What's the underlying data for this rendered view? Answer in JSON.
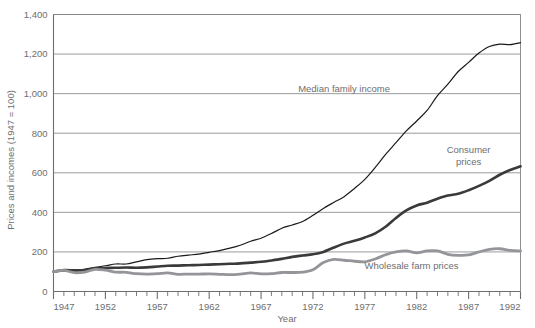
{
  "chart_data": {
    "type": "line",
    "title": "",
    "xlabel": "Year",
    "ylabel": "Prices and incomes (1947 = 100)",
    "xlim": [
      1947,
      1992
    ],
    "ylim": [
      0,
      1400
    ],
    "grid": true,
    "legend_position": "inline-annotations",
    "y_ticks": [
      0,
      200,
      400,
      600,
      800,
      1000,
      1200,
      1400
    ],
    "y_tick_labels": [
      "0",
      "200",
      "400",
      "600",
      "800",
      "1,000",
      "1,200",
      "1,400"
    ],
    "x_ticks": [
      1947,
      1952,
      1957,
      1962,
      1967,
      1972,
      1977,
      1982,
      1987,
      1992
    ],
    "x_tick_labels": [
      "1947",
      "1952",
      "1957",
      "1962",
      "1967",
      "1972",
      "1977",
      "1982",
      "1987",
      "1992"
    ],
    "x_minor_tick_interval": 1,
    "x": [
      1947,
      1948,
      1949,
      1950,
      1951,
      1952,
      1953,
      1954,
      1955,
      1956,
      1957,
      1958,
      1959,
      1960,
      1961,
      1962,
      1963,
      1964,
      1965,
      1966,
      1967,
      1968,
      1969,
      1970,
      1971,
      1972,
      1973,
      1974,
      1975,
      1976,
      1977,
      1978,
      1979,
      1980,
      1981,
      1982,
      1983,
      1984,
      1985,
      1986,
      1987,
      1988,
      1989,
      1990,
      1991,
      1992
    ],
    "series": [
      {
        "name": "Median family income",
        "label": "Median family income",
        "color": "#1a1a1a",
        "width": 1.2,
        "values": [
          100,
          104,
          103,
          112,
          122,
          130,
          139,
          139,
          150,
          161,
          166,
          168,
          178,
          184,
          189,
          198,
          207,
          219,
          234,
          254,
          269,
          293,
          320,
          336,
          354,
          385,
          420,
          450,
          479,
          521,
          567,
          627,
          693,
          752,
          812,
          862,
          915,
          990,
          1048,
          1112,
          1158,
          1205,
          1238,
          1250,
          1248,
          1258
        ]
      },
      {
        "name": "Consumer prices",
        "label": "Consumer prices",
        "color": "#3a3a3a",
        "width": 2.6,
        "values": [
          100,
          108,
          107,
          108,
          117,
          119,
          120,
          121,
          120,
          122,
          126,
          130,
          131,
          133,
          134,
          136,
          138,
          140,
          142,
          146,
          150,
          157,
          165,
          175,
          182,
          188,
          200,
          222,
          242,
          256,
          273,
          294,
          327,
          372,
          410,
          435,
          449,
          469,
          485,
          494,
          512,
          534,
          559,
          590,
          614,
          633
        ]
      },
      {
        "name": "Wholesale farm prices",
        "label": "Wholesale farm prices",
        "color": "#939598",
        "width": 2.8,
        "values": [
          100,
          107,
          95,
          98,
          112,
          108,
          98,
          97,
          90,
          88,
          90,
          94,
          87,
          88,
          88,
          89,
          87,
          85,
          88,
          94,
          89,
          90,
          96,
          96,
          98,
          110,
          146,
          162,
          158,
          153,
          150,
          164,
          186,
          200,
          205,
          195,
          205,
          205,
          188,
          183,
          185,
          200,
          213,
          216,
          208,
          205
        ]
      }
    ],
    "annotations": [
      {
        "text": "Median family income",
        "x": 1975.0,
        "y": 1010,
        "name": "median-family-income-label"
      },
      {
        "text": "Consumer prices",
        "x": 1987.0,
        "y": 700,
        "name": "consumer-prices-label",
        "lines": [
          "Consumer",
          "prices"
        ]
      },
      {
        "text": "Wholesale farm prices",
        "x": 1981.5,
        "y": 115,
        "name": "wholesale-farm-prices-label"
      }
    ]
  },
  "colors": {
    "background": "#ffffff",
    "grid": "#808285",
    "axis": "#6d6e70",
    "text": "#6d6e70",
    "median_family_income": "#1a1a1a",
    "consumer_prices": "#3a3a3a",
    "wholesale_farm_prices": "#939598"
  }
}
